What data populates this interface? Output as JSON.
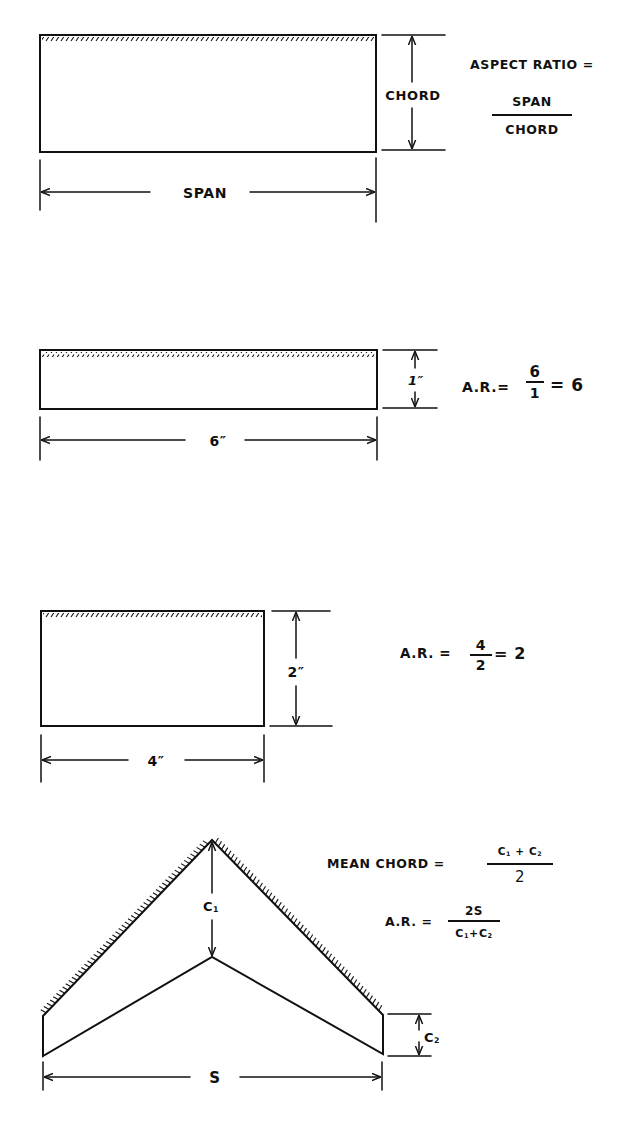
{
  "diagram": {
    "colors": {
      "ink": "#111111",
      "paper": "#ffffff"
    },
    "figure1": {
      "dimension_chord": "CHORD",
      "dimension_span": "SPAN",
      "formula_label": "ASPECT RATIO =",
      "formula_numerator": "SPAN",
      "formula_denominator": "CHORD"
    },
    "figure2": {
      "dimension_chord": "1″",
      "dimension_span": "6″",
      "formula_label": "A.R.=",
      "formula_numerator": "6",
      "formula_denominator": "1",
      "formula_result": "= 6"
    },
    "figure3": {
      "dimension_chord": "2″",
      "dimension_span": "4″",
      "formula_label": "A.R. =",
      "formula_numerator": "4",
      "formula_denominator": "2",
      "formula_result": "= 2"
    },
    "figure4": {
      "dimension_root_chord": "C1",
      "dimension_tip_chord": "C2",
      "dimension_span": "S",
      "mean_chord_label": "MEAN CHORD =",
      "mean_chord_numerator": "C1 + C2",
      "mean_chord_denominator": "2",
      "ar_label": "A.R. =",
      "ar_numerator": "2S",
      "ar_denominator": "C1 + C2"
    }
  }
}
